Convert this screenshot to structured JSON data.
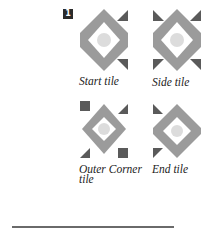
{
  "step_badge": "1",
  "colors": {
    "diamond": "#9b9b9b",
    "diamond_inner": "#ffffff",
    "circle": "#dcdcdc",
    "corner": "#5a5a5a"
  },
  "tiles": [
    {
      "label": "Start tile",
      "corners": [
        "top-right-triangle",
        "bottom-right-triangle"
      ]
    },
    {
      "label": "Side tile",
      "corners": [
        "top-left-triangle",
        "top-right-triangle",
        "bottom-left-triangle",
        "bottom-right-triangle"
      ]
    },
    {
      "label": "Outer Corner tile",
      "label_line1": "Outer Corner",
      "label_line2": "tile",
      "corners": [
        "top-left-square",
        "top-right-triangle",
        "bottom-left-triangle",
        "bottom-right-square"
      ]
    },
    {
      "label": "End tile",
      "corners": [
        "top-left-triangle",
        "bottom-left-triangle"
      ]
    }
  ]
}
